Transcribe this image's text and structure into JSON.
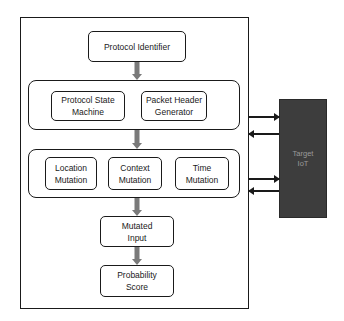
{
  "diagram": {
    "protocol_identifier": "Protocol Identifier",
    "group1": {
      "protocol_state_machine": [
        "Protocol State",
        "Machine"
      ],
      "packet_header_generator": [
        "Packet Header",
        "Generator"
      ]
    },
    "group2": {
      "location_mutation": [
        "Location",
        "Mutation"
      ],
      "context_mutation": [
        "Context",
        "Mutation"
      ],
      "time_mutation": [
        "Time",
        "Mutation"
      ]
    },
    "mutated_input": [
      "Mutated",
      "Input"
    ],
    "probability_score": [
      "Probability",
      "Score"
    ],
    "target": [
      "Target",
      "IoT"
    ]
  },
  "colors": {
    "flow_arrow": "#7a7a7a",
    "target_fill": "#3d3d3d",
    "border": "#1a1a1a"
  }
}
